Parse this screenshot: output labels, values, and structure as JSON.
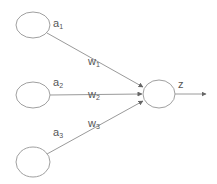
{
  "diagram": {
    "type": "perceptron / single neuron",
    "inputs": [
      {
        "label": "a",
        "sub": "1",
        "weight": "w",
        "weight_sub": "1"
      },
      {
        "label": "a",
        "sub": "2",
        "weight": "w",
        "weight_sub": "2"
      },
      {
        "label": "a",
        "sub": "3",
        "weight": "w",
        "weight_sub": "3"
      }
    ],
    "output": {
      "label": "z"
    },
    "colors": {
      "stroke": "#a0a0a0",
      "text": "#555555",
      "background": "#ffffff"
    }
  }
}
